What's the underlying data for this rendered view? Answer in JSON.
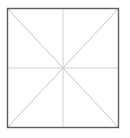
{
  "figure": {
    "name": "square-with-diagonals-and-midlines",
    "background_color": "#ffffff",
    "canvas": {
      "width": 130,
      "height": 138
    },
    "square": {
      "name": "outer-square",
      "left": 7.5,
      "top": 8.5,
      "right": 118.5,
      "bottom": 127.5,
      "width": 111,
      "height": 119,
      "stroke_color": "#5e5e5e",
      "stroke_width": 1.4,
      "fill_color": "none"
    },
    "center_point": {
      "x": 63,
      "y": 68
    },
    "interior_lines": [
      {
        "name": "diagonal-top-left-to-bottom-right",
        "x1": 7.5,
        "y1": 8.5,
        "x2": 118.5,
        "y2": 127.5,
        "stroke_color": "#c6c6c6",
        "stroke_width": 1.0
      },
      {
        "name": "diagonal-top-right-to-bottom-left",
        "x1": 118.5,
        "y1": 8.5,
        "x2": 7.5,
        "y2": 127.5,
        "stroke_color": "#c6c6c6",
        "stroke_width": 1.0
      },
      {
        "name": "horizontal-midline",
        "x1": 7.5,
        "y1": 68,
        "x2": 118.5,
        "y2": 68,
        "stroke_color": "#cfcfcf",
        "stroke_width": 1.0
      },
      {
        "name": "vertical-midline",
        "x1": 63,
        "y1": 8.5,
        "x2": 63,
        "y2": 127.5,
        "stroke_color": "#cfcfcf",
        "stroke_width": 1.0
      }
    ],
    "labels": []
  }
}
